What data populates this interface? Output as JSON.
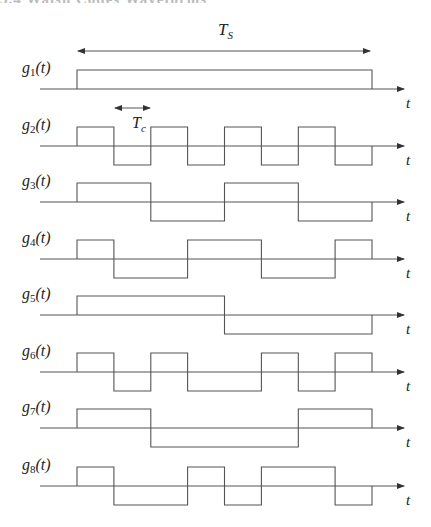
{
  "header": {
    "clipped_text": "3.4 Walsh Codes Waveforms"
  },
  "diagram": {
    "period_label": "T",
    "period_label_sub": "S",
    "chip_label": "T",
    "chip_label_sub": "c",
    "time_axis_label": "t",
    "chips_per_code": 8,
    "stroke_color": "#555555",
    "signals": [
      {
        "name": "g",
        "index": "1",
        "arg": "(t)",
        "chips": [
          1,
          1,
          1,
          1,
          1,
          1,
          1,
          1
        ]
      },
      {
        "name": "g",
        "index": "2",
        "arg": "(t)",
        "chips": [
          1,
          -1,
          1,
          -1,
          1,
          -1,
          1,
          -1
        ]
      },
      {
        "name": "g",
        "index": "3",
        "arg": "(t)",
        "chips": [
          1,
          1,
          -1,
          -1,
          1,
          1,
          -1,
          -1
        ]
      },
      {
        "name": "g",
        "index": "4",
        "arg": "(t)",
        "chips": [
          1,
          -1,
          -1,
          1,
          1,
          -1,
          -1,
          1
        ]
      },
      {
        "name": "g",
        "index": "5",
        "arg": "(t)",
        "chips": [
          1,
          1,
          1,
          1,
          -1,
          -1,
          -1,
          -1
        ]
      },
      {
        "name": "g",
        "index": "6",
        "arg": "(t)",
        "chips": [
          1,
          -1,
          1,
          -1,
          -1,
          1,
          -1,
          1
        ]
      },
      {
        "name": "g",
        "index": "7",
        "arg": "(t)",
        "chips": [
          1,
          1,
          -1,
          -1,
          -1,
          -1,
          1,
          1
        ]
      },
      {
        "name": "g",
        "index": "8",
        "arg": "(t)",
        "chips": [
          1,
          -1,
          -1,
          1,
          -1,
          1,
          1,
          -1
        ]
      }
    ]
  }
}
